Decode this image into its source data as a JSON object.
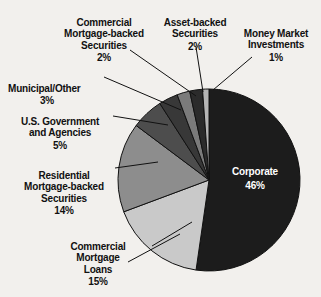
{
  "chart_data": {
    "type": "pie",
    "title": "",
    "categories": [
      "Corporate",
      "Commercial Mortgage Loans",
      "Residential Mortgage-backed Securities",
      "U.S. Government and Agencies",
      "Municipal/Other",
      "Commercial Mortgage-backed Securities",
      "Asset-backed Securities",
      "Money Market Investments"
    ],
    "values": [
      46,
      15,
      14,
      5,
      3,
      2,
      2,
      1
    ],
    "value_labels": [
      "46%",
      "15%",
      "14%",
      "5%",
      "3%",
      "2%",
      "2%",
      "1%"
    ],
    "unit": "%",
    "legend": "none",
    "start_angle_deg": 0,
    "direction": "clockwise",
    "slice_colors": [
      "#1c1c1c",
      "#c9c9c9",
      "#8d8d8d",
      "#4d4d4d",
      "#383838",
      "#7b7b7b",
      "#2b2b2b",
      "#b5b5b5"
    ],
    "background_color": "#f2f0ed",
    "outline_color": "#111111",
    "inner_label_color": "#ffffff",
    "label_color": "#111111"
  },
  "slices": [
    {
      "name": "corporate",
      "label_line1": "Corporate",
      "percent": "46%",
      "placement": "inside"
    },
    {
      "name": "commercial-mortgage-loans",
      "label_line1": "Commercial\nMortgage\nLoans",
      "percent": "15%",
      "placement": "outside"
    },
    {
      "name": "residential-mortgage-backed-securities",
      "label_line1": "Residential\nMortgage-backed\nSecurities",
      "percent": "14%",
      "placement": "outside"
    },
    {
      "name": "us-government-and-agencies",
      "label_line1": "U.S. Government\nand Agencies",
      "percent": "5%",
      "placement": "outside"
    },
    {
      "name": "municipal-other",
      "label_line1": "Municipal/Other",
      "percent": "3%",
      "placement": "outside"
    },
    {
      "name": "commercial-mortgage-backed-securities",
      "label_line1": "Commercial\nMortgage-backed\nSecurities",
      "percent": "2%",
      "placement": "outside"
    },
    {
      "name": "asset-backed-securities",
      "label_line1": "Asset-backed\nSecurities",
      "percent": "2%",
      "placement": "outside"
    },
    {
      "name": "money-market-investments",
      "label_line1": "Money Market\nInvestments",
      "percent": "1%",
      "placement": "outside"
    }
  ]
}
